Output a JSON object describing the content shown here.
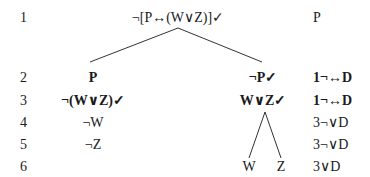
{
  "tree": {
    "line_numbers": [
      "1",
      "2",
      "3",
      "4",
      "5",
      "6"
    ],
    "root": {
      "formula": "¬[P↔(W∨Z)]✓",
      "justification": "P"
    },
    "left_branch": {
      "row2": "P",
      "row3": "¬(W∨Z)✓",
      "row4": "¬W",
      "row5": "¬Z"
    },
    "right_branch": {
      "row2": "¬P✓",
      "row3": "W∨Z✓",
      "sub_left": "W",
      "sub_right": "Z"
    },
    "justifications": {
      "row2": "1¬↔D",
      "row3": "1¬↔D",
      "row4": "3¬∨D",
      "row5": "3¬∨D",
      "row6": "3∨D"
    }
  }
}
